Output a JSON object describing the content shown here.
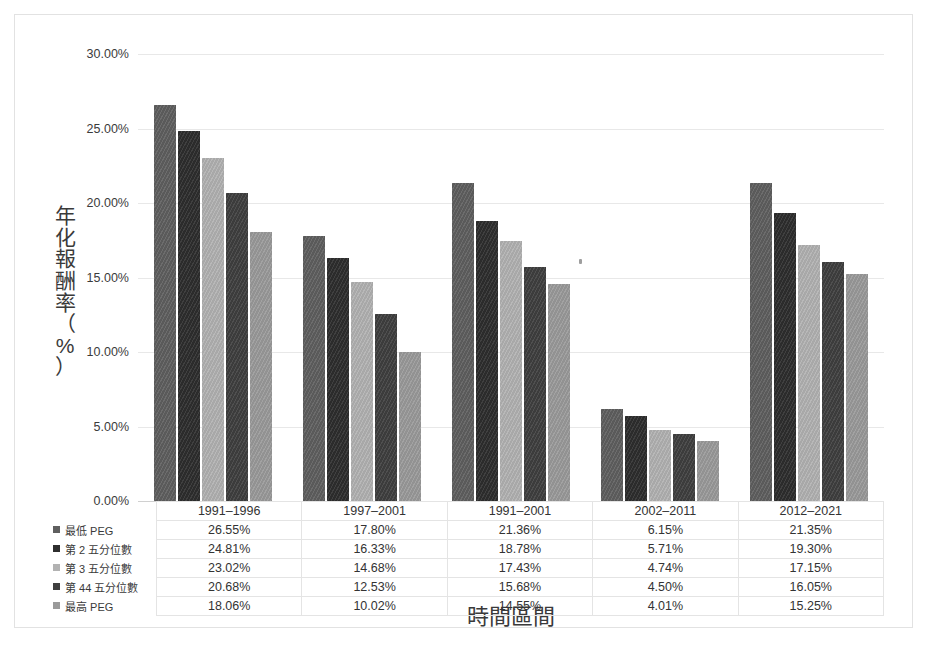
{
  "chart_data": {
    "type": "bar",
    "title": "",
    "xlabel": "時間區間",
    "ylabel": "年化報酬率（%）",
    "ylim": [
      0,
      30
    ],
    "ytick_labels": [
      "0.00%",
      "5.00%",
      "10.00%",
      "15.00%",
      "20.00%",
      "25.00%",
      "30.00%"
    ],
    "ytick_values": [
      0,
      5,
      10,
      15,
      20,
      25,
      30
    ],
    "grid": true,
    "legend_position": "table-left",
    "categories": [
      "1991–1996",
      "1997–2001",
      "1991–2001",
      "2002–2011",
      "2012–2021"
    ],
    "series": [
      {
        "name": "最低 PEG",
        "color": "#5f5f5f",
        "values": [
          26.55,
          17.8,
          21.36,
          6.15,
          21.35
        ],
        "labels": [
          "26.55%",
          "17.80%",
          "21.36%",
          "6.15%",
          "21.35%"
        ]
      },
      {
        "name": "第 2 五分位數",
        "color": "#2e2e2e",
        "values": [
          24.81,
          16.33,
          18.78,
          5.71,
          19.3
        ],
        "labels": [
          "24.81%",
          "16.33%",
          "18.78%",
          "5.71%",
          "19.30%"
        ]
      },
      {
        "name": "第 3 五分位數",
        "color": "#b2b2b2",
        "values": [
          23.02,
          14.68,
          17.43,
          4.74,
          17.15
        ],
        "labels": [
          "23.02%",
          "14.68%",
          "17.43%",
          "4.74%",
          "17.15%"
        ]
      },
      {
        "name": "第 44 五分位數",
        "color": "#3f3f3f",
        "values": [
          20.68,
          12.53,
          15.68,
          4.5,
          16.05
        ],
        "labels": [
          "20.68%",
          "12.53%",
          "15.68%",
          "4.50%",
          "16.05%"
        ]
      },
      {
        "name": "最高 PEG",
        "color": "#9a9a9a",
        "values": [
          18.06,
          10.02,
          14.55,
          4.01,
          15.25
        ],
        "labels": [
          "18.06%",
          "10.02%",
          "14.55%",
          "4.01%",
          "15.25%"
        ]
      }
    ]
  },
  "y_axis_title_chars": [
    "年",
    "化",
    "報",
    "酬",
    "率",
    "（",
    "%",
    "）"
  ]
}
